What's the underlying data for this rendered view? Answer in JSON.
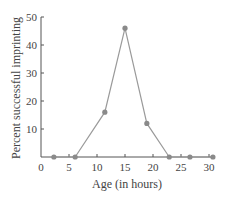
{
  "chart_data": {
    "type": "line",
    "title": "",
    "xlabel": "Age (in hours)",
    "ylabel": "Percent successful imprinting",
    "xlim": [
      0,
      31
    ],
    "ylim": [
      0,
      50
    ],
    "xticks": [
      0,
      5,
      10,
      15,
      20,
      25,
      30
    ],
    "yticks": [
      10,
      20,
      30,
      40,
      50
    ],
    "grid": false,
    "legend": null,
    "series": [
      {
        "name": "Imprinting success",
        "x": [
          2.3,
          6.1,
          11.4,
          15,
          18.9,
          22.9,
          26.6,
          30.7
        ],
        "values": [
          0,
          0,
          16,
          46,
          12,
          0,
          0,
          0
        ]
      }
    ]
  },
  "colors": {
    "axis": "#555555",
    "line": "#9a9a9a",
    "marker": "#8a8a8a",
    "text": "#444444"
  }
}
